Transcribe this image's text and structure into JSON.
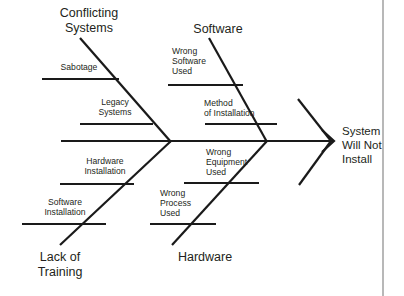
{
  "diagram": {
    "type": "fishbone-ishikawa",
    "title": "System Will Not Install",
    "effect": {
      "label": "System\nWill Not\nInstall",
      "x": 342,
      "y": 124,
      "align": "left"
    },
    "spine": {
      "x1": 61,
      "y1": 141,
      "x2": 334,
      "y2": 141,
      "arrow": "right"
    },
    "colors": {
      "line": "#1a1a1a",
      "text": "#231f20",
      "background": "#ffffff",
      "page_edge": "#b8b8b8"
    },
    "page_edge": {
      "x": 383,
      "y1": 0,
      "y2": 296
    },
    "categories": [
      {
        "name": "conflicting-systems",
        "label": "Conflicting\nSystems",
        "label_x": 89,
        "label_y": 6,
        "align": "center",
        "bone": {
          "x1": 80,
          "y1": 38,
          "x2": 171,
          "y2": 142
        }
      },
      {
        "name": "software",
        "label": "Software",
        "label_x": 218,
        "label_y": 22,
        "align": "center",
        "bone": {
          "x1": 209,
          "y1": 38,
          "x2": 267,
          "y2": 142
        }
      },
      {
        "name": "lack-of-training",
        "label": "Lack of\nTraining",
        "label_x": 60,
        "label_y": 250,
        "align": "center",
        "bone": {
          "x1": 60,
          "y1": 245,
          "x2": 171,
          "y2": 141
        }
      },
      {
        "name": "hardware",
        "label": "Hardware",
        "label_x": 205,
        "label_y": 250,
        "align": "center",
        "bone": {
          "x1": 172,
          "y1": 245,
          "x2": 267,
          "y2": 141
        }
      }
    ],
    "extra_bones": [
      {
        "name": "unlabeled-upper-right",
        "x1": 298,
        "y1": 99,
        "x2": 331,
        "y2": 141
      },
      {
        "name": "unlabeled-lower-right",
        "x1": 299,
        "y1": 185,
        "x2": 331,
        "y2": 141
      }
    ],
    "causes": [
      {
        "name": "sabotage",
        "label": "Sabotage",
        "label_x": 79,
        "label_y": 62,
        "align": "center",
        "line": {
          "x1": 42,
          "y1": 79,
          "x2": 119,
          "y2": 79
        }
      },
      {
        "name": "legacy-systems",
        "label": "Legacy\nSystems",
        "label_x": 115,
        "label_y": 97,
        "align": "center",
        "line": {
          "x1": 80,
          "y1": 124,
          "x2": 153,
          "y2": 124
        }
      },
      {
        "name": "wrong-software-used",
        "label": "Wrong\nSoftware\nUsed",
        "label_x": 172,
        "label_y": 46,
        "align": "left",
        "line": {
          "x1": 168,
          "y1": 85,
          "x2": 243,
          "y2": 85
        }
      },
      {
        "name": "method-of-installation",
        "label": "Method\nof Installation",
        "label_x": 204,
        "label_y": 98,
        "align": "left",
        "line": {
          "x1": 205,
          "y1": 124,
          "x2": 277,
          "y2": 124
        }
      },
      {
        "name": "hardware-installation",
        "label": "Hardware\nInstallation",
        "label_x": 105,
        "label_y": 156,
        "align": "center",
        "line": {
          "x1": 60,
          "y1": 184,
          "x2": 134,
          "y2": 184
        }
      },
      {
        "name": "software-installation",
        "label": "Software\nInstallation",
        "label_x": 65,
        "label_y": 197,
        "align": "center",
        "line": {
          "x1": 22,
          "y1": 224,
          "x2": 106,
          "y2": 224
        }
      },
      {
        "name": "wrong-equipment-used",
        "label": "Wrong\nEquipment\nUsed",
        "label_x": 206,
        "label_y": 147,
        "align": "left",
        "line": {
          "x1": 184,
          "y1": 183,
          "x2": 259,
          "y2": 183
        }
      },
      {
        "name": "wrong-process-used",
        "label": "Wrong\nProcess\nUsed",
        "label_x": 160,
        "label_y": 188,
        "align": "left",
        "line": {
          "x1": 150,
          "y1": 224,
          "x2": 216,
          "y2": 224
        }
      }
    ]
  }
}
